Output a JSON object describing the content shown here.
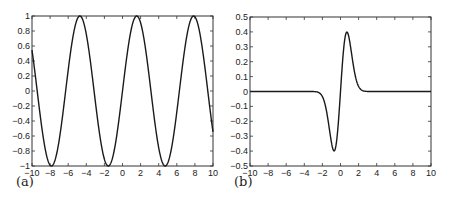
{
  "chart_data": [
    {
      "id": "a",
      "type": "line",
      "panel_label": "(a)",
      "title": "",
      "xlabel": "",
      "ylabel": "",
      "function_description": "sin(x)",
      "xlim": [
        -10,
        10
      ],
      "ylim": [
        -1,
        1
      ],
      "xticks": [
        -10,
        -8,
        -6,
        -4,
        -2,
        0,
        2,
        4,
        6,
        8,
        10
      ],
      "yticks": [
        -1,
        -0.8,
        -0.6,
        -0.4,
        -0.2,
        0,
        0.2,
        0.4,
        0.6,
        0.8,
        1
      ],
      "xtick_labels": [
        "-10",
        "-8",
        "-6",
        "-4",
        "-2",
        "0",
        "2",
        "4",
        "6",
        "8",
        "10"
      ],
      "ytick_labels": [
        "-1",
        "-0.8",
        "-0.6",
        "-0.4",
        "-0.2",
        "0",
        "0.2",
        "0.4",
        "0.6",
        "0.8",
        "1"
      ],
      "grid": false,
      "series": [
        {
          "name": "curve",
          "x": [
            -10,
            -9,
            -8,
            -7.85,
            -7,
            -6,
            -5,
            -4.71,
            -4,
            -3,
            -2,
            -1.57,
            -1,
            0,
            1,
            1.57,
            2,
            3,
            4,
            4.71,
            5,
            6,
            7,
            7.85,
            8,
            9,
            10
          ],
          "y": [
            0.54,
            -0.41,
            -0.99,
            -1.0,
            -0.66,
            0.28,
            0.96,
            1.0,
            0.76,
            -0.14,
            -0.91,
            -1.0,
            -0.84,
            0.0,
            0.84,
            1.0,
            0.91,
            0.14,
            -0.76,
            -1.0,
            -0.96,
            -0.28,
            0.66,
            1.0,
            0.99,
            0.41,
            -0.54
          ]
        }
      ]
    },
    {
      "id": "b",
      "type": "line",
      "panel_label": "(b)",
      "title": "",
      "xlabel": "",
      "ylabel": "",
      "function_description": "odd derivative-of-Gaussian shaped pulse centered at 0",
      "xlim": [
        -10,
        10
      ],
      "ylim": [
        -0.5,
        0.5
      ],
      "xticks": [
        -10,
        -8,
        -6,
        -4,
        -2,
        0,
        2,
        4,
        6,
        8,
        10
      ],
      "yticks": [
        -0.5,
        -0.4,
        -0.3,
        -0.2,
        -0.1,
        0,
        0.1,
        0.2,
        0.3,
        0.4,
        0.5
      ],
      "xtick_labels": [
        "-10",
        "-8",
        "-6",
        "-4",
        "-2",
        "0",
        "2",
        "4",
        "6",
        "8",
        "10"
      ],
      "ytick_labels": [
        "-0.5",
        "-0.4",
        "-0.3",
        "-0.2",
        "-0.1",
        "0",
        "0.1",
        "0.2",
        "0.3",
        "0.4",
        "0.5"
      ],
      "grid": false,
      "series": [
        {
          "name": "curve",
          "x": [
            -10,
            -3,
            -2.5,
            -2,
            -1.5,
            -1,
            -0.7,
            -0.5,
            0,
            0.5,
            0.7,
            1,
            1.5,
            2,
            2.5,
            3,
            10
          ],
          "y": [
            0,
            0.0,
            -0.004,
            -0.034,
            -0.147,
            -0.342,
            -0.4,
            -0.362,
            0.0,
            0.362,
            0.4,
            0.342,
            0.147,
            0.034,
            0.004,
            0.0,
            0
          ]
        }
      ]
    }
  ]
}
